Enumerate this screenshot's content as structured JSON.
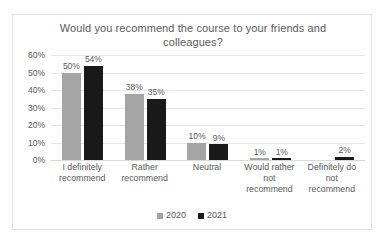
{
  "chart_data": {
    "type": "bar",
    "title": "Would you recommend the course to your friends and colleagues?",
    "xlabel": "",
    "ylabel": "",
    "ylim": [
      0,
      60
    ],
    "ytick_labels": [
      "60%",
      "50%",
      "40%",
      "30%",
      "20%",
      "10%",
      "0%"
    ],
    "yticks": [
      60,
      50,
      40,
      30,
      20,
      10,
      0
    ],
    "grid": true,
    "legend_position": "bottom",
    "categories": [
      "I definitely recommend",
      "Rather recommend",
      "Neutral",
      "Would rather not recommend",
      "Definitely do not recommend"
    ],
    "series": [
      {
        "name": "2020",
        "color": "#a5a5a5",
        "values": [
          50,
          38,
          10,
          1,
          null
        ],
        "labels": [
          "50%",
          "38%",
          "10%",
          "1%",
          ""
        ]
      },
      {
        "name": "2021",
        "color": "#191919",
        "values": [
          54,
          35,
          9,
          1,
          2
        ],
        "labels": [
          "54%",
          "35%",
          "9%",
          "1%",
          "2%"
        ]
      }
    ]
  },
  "legend": {
    "items": [
      {
        "label": "2020",
        "color": "#a5a5a5"
      },
      {
        "label": "2021",
        "color": "#191919"
      }
    ]
  },
  "colors": {
    "series_2020": "#a5a5a5",
    "series_2021": "#191919",
    "gridline": "#e8e8e8",
    "text": "#5a5a5a",
    "frame": "#e3e3e3",
    "background": "#ffffff"
  }
}
